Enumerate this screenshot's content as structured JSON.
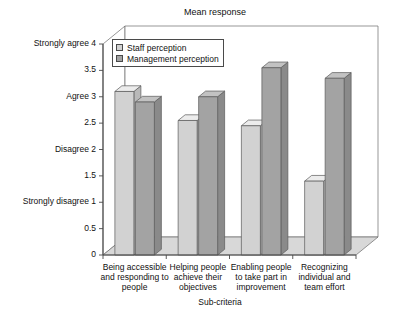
{
  "chart_data": {
    "type": "bar",
    "title": "Mean response",
    "xlabel": "Sub-criteria",
    "ylabel": "",
    "ylim": [
      0,
      4
    ],
    "grid": false,
    "legend_position": "top-left-inside",
    "style": "3d-grouped-bar",
    "categories": [
      "Being accessible and responding to people",
      "Helping people achieve their objectives",
      "Enabling people to take part in improvement",
      "Recognizing individual and team effort"
    ],
    "category_lines": [
      [
        "Being accessible",
        "and responding to",
        "people"
      ],
      [
        "Helping people",
        "achieve their",
        "objectives"
      ],
      [
        "Enabling people",
        "to take part in",
        "improvement"
      ],
      [
        "Recognizing",
        "individual and",
        "team effort"
      ]
    ],
    "series": [
      {
        "name": "Staff perception",
        "color": "#d2d2d2",
        "values": [
          3.1,
          2.55,
          2.45,
          1.4
        ]
      },
      {
        "name": "Management perception",
        "color": "#a3a3a3",
        "values": [
          2.9,
          3.0,
          3.55,
          3.35
        ]
      }
    ],
    "yticks": [
      0,
      0.5,
      1,
      1.5,
      2,
      2.5,
      3,
      3.5,
      4
    ],
    "ytick_labels": [
      "0",
      "0.5",
      "Strongly disagree  1",
      "1.5",
      "Disagree  2",
      "2.5",
      "Agree  3",
      "3.5",
      "Strongly agree  4"
    ]
  },
  "legend": {
    "items": [
      {
        "label": "Staff perception"
      },
      {
        "label": "Management perception"
      }
    ]
  },
  "colors": {
    "bar_light_front": "#d2d2d2",
    "bar_light_top": "#ececec",
    "bar_light_side": "#b9b9b9",
    "bar_dark_front": "#a3a3a3",
    "bar_dark_top": "#c2c2c2",
    "bar_dark_side": "#8a8a8a",
    "floor": "#d8d8d8",
    "axis": "#4a4a4a",
    "background": "#ffffff"
  }
}
